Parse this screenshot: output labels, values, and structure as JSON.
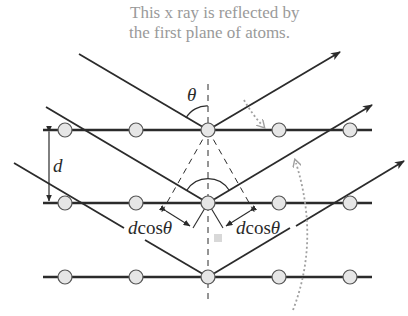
{
  "diagram": {
    "caption_top": {
      "line1": "This x ray is reflected by",
      "line2": "the first plane of atoms."
    },
    "labels": {
      "theta": "θ",
      "spacing": "d",
      "path_left_d": "d",
      "path_left_cos": "cos",
      "path_left_theta": "θ",
      "path_right_d": "d",
      "path_right_cos": "cos",
      "path_right_theta": "θ"
    },
    "planes": [
      {
        "name": "first-plane",
        "y": 130
      },
      {
        "name": "second-plane",
        "y": 203
      },
      {
        "name": "third-plane",
        "y": 277
      }
    ],
    "atom_x": [
      65,
      136,
      208,
      279,
      350
    ],
    "colors": {
      "line": "#2b2b2b",
      "atom_fill": "#e6e6e6",
      "atom_stroke": "#555555",
      "annotation": "#9a9a9a"
    }
  }
}
